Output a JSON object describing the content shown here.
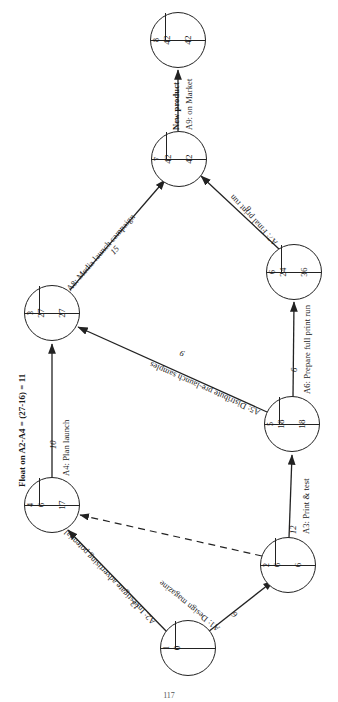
{
  "diagram": {
    "orientation_note": "page content rotated 90 degrees",
    "page_number": "117",
    "float_note": "Float on A2-A4 = (27-16) = 11",
    "nodes": [
      {
        "id": "1",
        "est": "0",
        "lft": "",
        "x": 188,
        "y": 648
      },
      {
        "id": "2",
        "est": "6",
        "lft": "6",
        "x": 288,
        "y": 565
      },
      {
        "id": "4",
        "est": "6",
        "lft": "17",
        "x": 52,
        "y": 505
      },
      {
        "id": "5",
        "est": "18",
        "lft": "18",
        "x": 292,
        "y": 424
      },
      {
        "id": "3",
        "est": "27",
        "lft": "27",
        "x": 52,
        "y": 313
      },
      {
        "id": "6",
        "est": "24",
        "lft": "36",
        "x": 294,
        "y": 272
      },
      {
        "id": "7",
        "est": "42",
        "lft": "42",
        "x": 179,
        "y": 159
      },
      {
        "id": "8",
        "est": "42",
        "lft": "42",
        "x": 178,
        "y": 40
      }
    ],
    "activities": [
      {
        "code": "A1",
        "name": "Design magazine",
        "label": "A1: Design magazine",
        "duration": "6",
        "from": "1",
        "to": "2"
      },
      {
        "code": "A2",
        "name": "Investigate advertising potential",
        "label": "A2: Investigate advertising potential",
        "duration": "13",
        "from": "1",
        "to": "4"
      },
      {
        "code": "A3",
        "name": "Print & test",
        "label": "A3: Print & test",
        "duration": "12",
        "from": "2",
        "to": "5"
      },
      {
        "code": "A4",
        "name": "Plan launch",
        "label": "A4:    Plan launch",
        "duration": "10",
        "from": "4",
        "to": "3"
      },
      {
        "code": "A5",
        "name": "Distribute pre-launch samples",
        "label": "A5: Distribute pre-launch samples",
        "duration": "9",
        "from": "5",
        "to": "3"
      },
      {
        "code": "A6",
        "name": "Prepare full print run",
        "label": "A6: Prepare full print run",
        "duration": "6",
        "from": "5",
        "to": "6"
      },
      {
        "code": "A7",
        "name": "Final print run",
        "label": "A7: Final print run",
        "duration": "6",
        "from": "6",
        "to": "7"
      },
      {
        "code": "A8",
        "name": "Media launch campaign",
        "label": "A8:  Media launch campaign",
        "duration": "15",
        "from": "3",
        "to": "7"
      },
      {
        "code": "A9",
        "name": "New product on Market",
        "label": "A9:  on Market",
        "label2": "New product",
        "duration": "",
        "from": "7",
        "to": "8"
      }
    ],
    "dummy": {
      "label": "",
      "from": "2",
      "to": "4"
    }
  }
}
